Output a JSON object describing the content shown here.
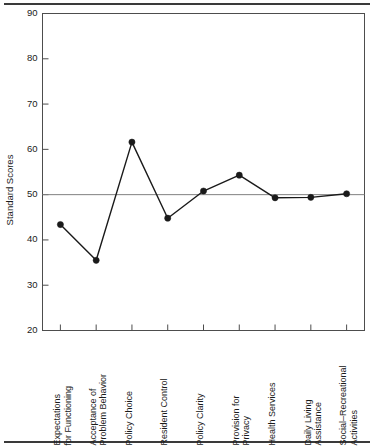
{
  "chart_data": {
    "type": "line",
    "title": "",
    "xlabel": "",
    "ylabel": "Standard Scores",
    "ylim": [
      20,
      90
    ],
    "yticks": [
      20,
      30,
      40,
      50,
      60,
      70,
      80,
      90
    ],
    "ytick_labels": [
      "20",
      "30",
      "40",
      "50",
      "60",
      "70",
      "80",
      "90"
    ],
    "grid": false,
    "legend": false,
    "reference_line": {
      "axis": "y",
      "value": 50,
      "color": "#808080",
      "label": "50"
    },
    "marker": "filled-circle",
    "line_color": "#1a1a1a",
    "marker_color": "#1a1a1a",
    "categories": [
      "Expectations for Functioning",
      "Acceptance of Problem Behavior",
      "Policy Choice",
      "Resident Control",
      "Policy Clarity",
      "Provision for Privacy",
      "Health Services",
      "Daily Living Assistance",
      "Social–Recreational Activities"
    ],
    "category_lines": [
      [
        "Expectations",
        "for Functioning"
      ],
      [
        "Acceptance of",
        "Problem Behavior"
      ],
      [
        "Policy Choice"
      ],
      [
        "Resident Control"
      ],
      [
        "Policy Clarity"
      ],
      [
        "Provision for",
        "Privacy"
      ],
      [
        "Health Services"
      ],
      [
        "Daily Living",
        "Assistance"
      ],
      [
        "Social–Recreational",
        "Activities"
      ]
    ],
    "values": [
      43.4,
      35.5,
      61.6,
      44.8,
      50.8,
      54.3,
      49.3,
      49.4,
      50.2
    ]
  },
  "axes": {
    "y_title": "Standard Scores"
  },
  "colors": {
    "line": "#1a1a1a",
    "marker": "#1a1a1a",
    "axis": "#4d4d4d",
    "reference": "#808080",
    "rule": "#3a3a3a",
    "background": "#ffffff"
  }
}
